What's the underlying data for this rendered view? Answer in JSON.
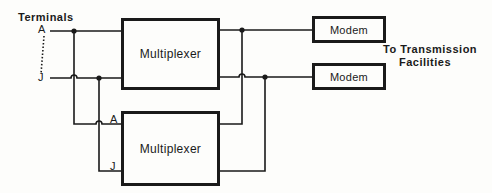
{
  "diagram": {
    "terminals_label": "Terminals",
    "terminal_a": "A",
    "terminal_j": "J",
    "mux_top_label": "Multiplexer",
    "mux_bottom_label": "Multiplexer",
    "mux_bottom_input_a": "A",
    "mux_bottom_input_j": "J",
    "modem_top_label": "Modem",
    "modem_bottom_label": "Modem",
    "destination_line1": "To Transmission",
    "destination_line2": "Facilities"
  }
}
